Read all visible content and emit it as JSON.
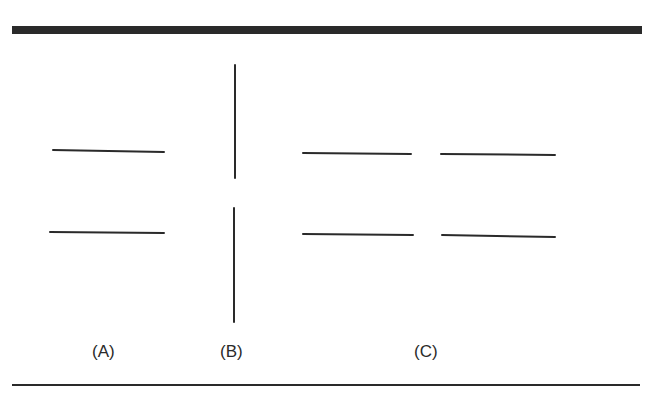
{
  "figure": {
    "labels": {
      "a": "(A)",
      "b": "(B)",
      "c": "(C)"
    },
    "line_color": "#2a2a2a",
    "panels": {
      "a": {
        "lines": [
          {
            "x1": 53,
            "y1": 150,
            "x2": 164,
            "y2": 152
          },
          {
            "x1": 50,
            "y1": 232,
            "x2": 164,
            "y2": 233
          }
        ]
      },
      "b": {
        "lines": [
          {
            "x1": 235,
            "y1": 65,
            "x2": 235,
            "y2": 178
          },
          {
            "x1": 234,
            "y1": 208,
            "x2": 234,
            "y2": 322
          }
        ]
      },
      "c": {
        "lines": [
          {
            "x1": 303,
            "y1": 153,
            "x2": 411,
            "y2": 154
          },
          {
            "x1": 441,
            "y1": 154,
            "x2": 555,
            "y2": 155
          },
          {
            "x1": 303,
            "y1": 234,
            "x2": 413,
            "y2": 235
          },
          {
            "x1": 442,
            "y1": 235,
            "x2": 555,
            "y2": 237
          }
        ]
      }
    }
  }
}
